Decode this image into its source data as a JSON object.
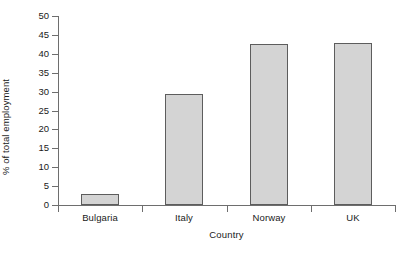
{
  "chart_data": {
    "type": "bar",
    "title": "",
    "subtitle": "",
    "xlabel": "Country",
    "ylabel": "% of total employment",
    "categories": [
      "Bulgaria",
      "Italy",
      "Norway",
      "UK"
    ],
    "values": [
      2.9,
      29.3,
      42.6,
      42.8
    ],
    "series": [
      {
        "name": "% of total employment",
        "values": [
          2.9,
          29.3,
          42.6,
          42.8
        ]
      }
    ],
    "ylim": [
      0,
      50
    ],
    "yticks": [
      0,
      5,
      10,
      15,
      20,
      25,
      30,
      35,
      40,
      45,
      50
    ],
    "ytick_labels": [
      "0",
      "5",
      "10",
      "15",
      "20",
      "25",
      "30",
      "35",
      "40",
      "45",
      "50"
    ],
    "grid": false,
    "legend": false,
    "legend_position": "none",
    "annotations": [],
    "colors": {
      "bar_fill": "#d4d4d4",
      "bar_edge": "#5d5d5d",
      "axis": "#6e6e6e",
      "text": "#1a1a1a",
      "background": "#ffffff"
    }
  }
}
